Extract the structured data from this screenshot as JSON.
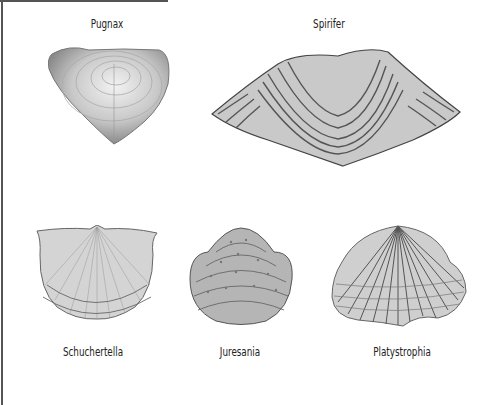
{
  "plate": {
    "specimens": [
      {
        "name": "Pugnax"
      },
      {
        "name": "Spirifer"
      },
      {
        "name": "Schuchertella"
      },
      {
        "name": "Juresania"
      },
      {
        "name": "Platystrophia"
      }
    ]
  }
}
